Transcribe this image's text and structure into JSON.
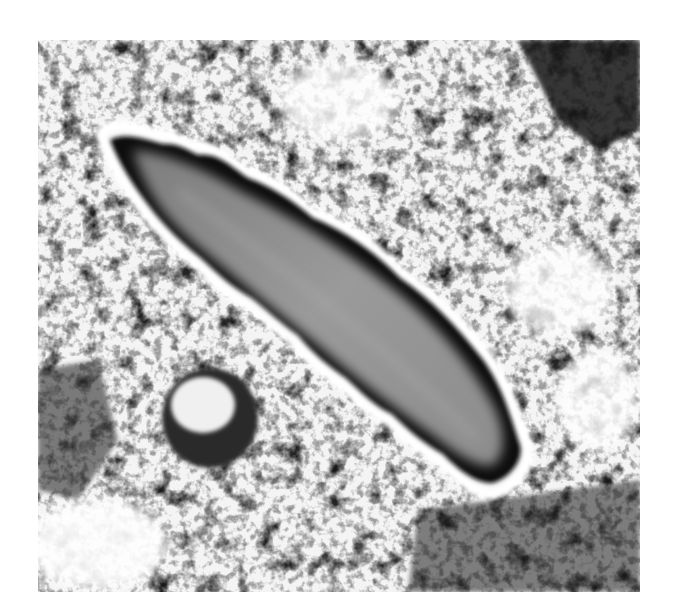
{
  "image": {
    "subject": "flatworm on mottled substrate",
    "colors": {
      "background": "#ffffff",
      "substrate_light": "#f2f2f2",
      "substrate_dark": "#1a1a1a",
      "body_center": "#8a8a8a",
      "body_edge": "#0a0a0a",
      "rim": "#f5f5f5"
    }
  }
}
